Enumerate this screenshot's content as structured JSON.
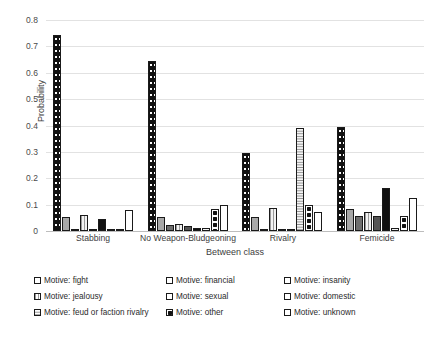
{
  "chart_data": {
    "type": "bar",
    "title": "",
    "xlabel": "Between class",
    "ylabel": "Probability",
    "ylim": [
      0,
      0.8
    ],
    "yticks": [
      "0",
      "0.1",
      "0.2",
      "0.3",
      "0.4",
      "0.5",
      "0.6",
      "0.7",
      "0.8"
    ],
    "grid": true,
    "legend_position": "bottom",
    "categories": [
      "Stabbing",
      "No Weapon-Bludgeoning",
      "Rivalry",
      "Femicide"
    ],
    "series": [
      {
        "name": "Motive: fight",
        "pattern": "black-with-white-dots",
        "values": [
          0.745,
          0.645,
          0.295,
          0.395
        ]
      },
      {
        "name": "Motive: financial",
        "pattern": "light-gray-solid",
        "values": [
          0.055,
          0.053,
          0.052,
          0.085
        ]
      },
      {
        "name": "Motive: insanity",
        "pattern": "medium-gray-solid",
        "values": [
          0.008,
          0.022,
          0.0,
          0.057
        ]
      },
      {
        "name": "Motive: jealousy",
        "pattern": "vertical-stripes",
        "values": [
          0.06,
          0.026,
          0.088,
          0.073
        ]
      },
      {
        "name": "Motive: sexual",
        "pattern": "dark-gray-solid",
        "values": [
          0.004,
          0.019,
          0.0,
          0.057
        ]
      },
      {
        "name": "Motive: domestic",
        "pattern": "black-solid",
        "values": [
          0.046,
          0.011,
          0.0,
          0.163
        ]
      },
      {
        "name": "Motive: feud or faction rivalry",
        "pattern": "horizontal-stripes",
        "values": [
          0.002,
          0.013,
          0.392,
          0.011
        ]
      },
      {
        "name": "Motive: other",
        "pattern": "large-black-dots",
        "values": [
          0.009,
          0.082,
          0.097,
          0.056
        ]
      },
      {
        "name": "Motive: unknown",
        "pattern": "white-solid",
        "values": [
          0.081,
          0.098,
          0.073,
          0.125
        ]
      }
    ]
  },
  "axes": {
    "y_title": "Probability",
    "x_title": "Between class"
  },
  "colors": {
    "gridline": "#e2e2e2",
    "axis_text": "#3d3d3d",
    "bar_outline": "#1a1a1a"
  }
}
